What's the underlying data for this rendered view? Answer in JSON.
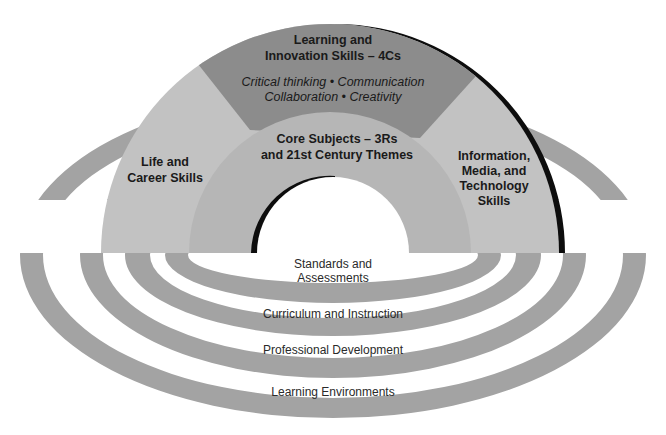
{
  "diagram": {
    "colors": {
      "outer_arch": "#c2c2c2",
      "core_arch": "#b6b6b6",
      "four_cs_band": "#8c8c8c",
      "shadow": "#0d0d0d",
      "ring": "#a3a3a3",
      "background": "#ffffff"
    },
    "arch": {
      "four_cs": {
        "title_line1": "Learning and",
        "title_line2": "Innovation Skills – 4Cs",
        "items_line1": "Critical thinking • Communication",
        "items_line2": "Collaboration • Creativity"
      },
      "life_career": {
        "line1": "Life and",
        "line2": "Career Skills"
      },
      "information_media": {
        "line1": "Information,",
        "line2": "Media, and",
        "line3": "Technology",
        "line4": "Skills"
      },
      "core_subjects": {
        "line1": "Core Subjects – 3Rs",
        "line2": "and 21st Century Themes"
      }
    },
    "support_systems": [
      {
        "line1": "Standards and",
        "line2": "Assessments"
      },
      {
        "line1": "Curriculum and Instruction"
      },
      {
        "line1": "Professional Development"
      },
      {
        "line1": "Learning Environments"
      }
    ]
  }
}
